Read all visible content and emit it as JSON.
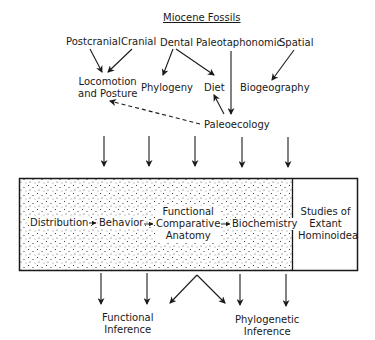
{
  "title": "Miocene Fossils",
  "sources": {
    "postcranial": "Postcranial",
    "cranial": "Cranial",
    "dental": "Dental",
    "paleotaphonomic": "Paleotaphonomic",
    "spatial": "Spatial"
  },
  "derived": {
    "locomotion_line1": "Locomotion",
    "locomotion_line2": "and Posture",
    "phylogeny": "Phylogeny",
    "diet": "Diet",
    "biogeography": "Biogeography",
    "paleoecology": "Paleoecology"
  },
  "box": {
    "distribution": "Distribution",
    "behavior": "Behavior",
    "fca_line1": "Functional",
    "fca_line2": "Comparative",
    "fca_line3": "Anatomy",
    "biochemistry": "Biochemistry",
    "extant_line1": "Studies of",
    "extant_line2": "Extant",
    "extant_line3": "Hominoidea"
  },
  "outputs": {
    "functional_line1": "Functional",
    "functional_line2": "Inference",
    "phylogenetic_line1": "Phylogenetic",
    "phylogenetic_line2": "Inference"
  },
  "colors": {
    "ink": "#1a1a1a",
    "background": "#ffffff"
  }
}
